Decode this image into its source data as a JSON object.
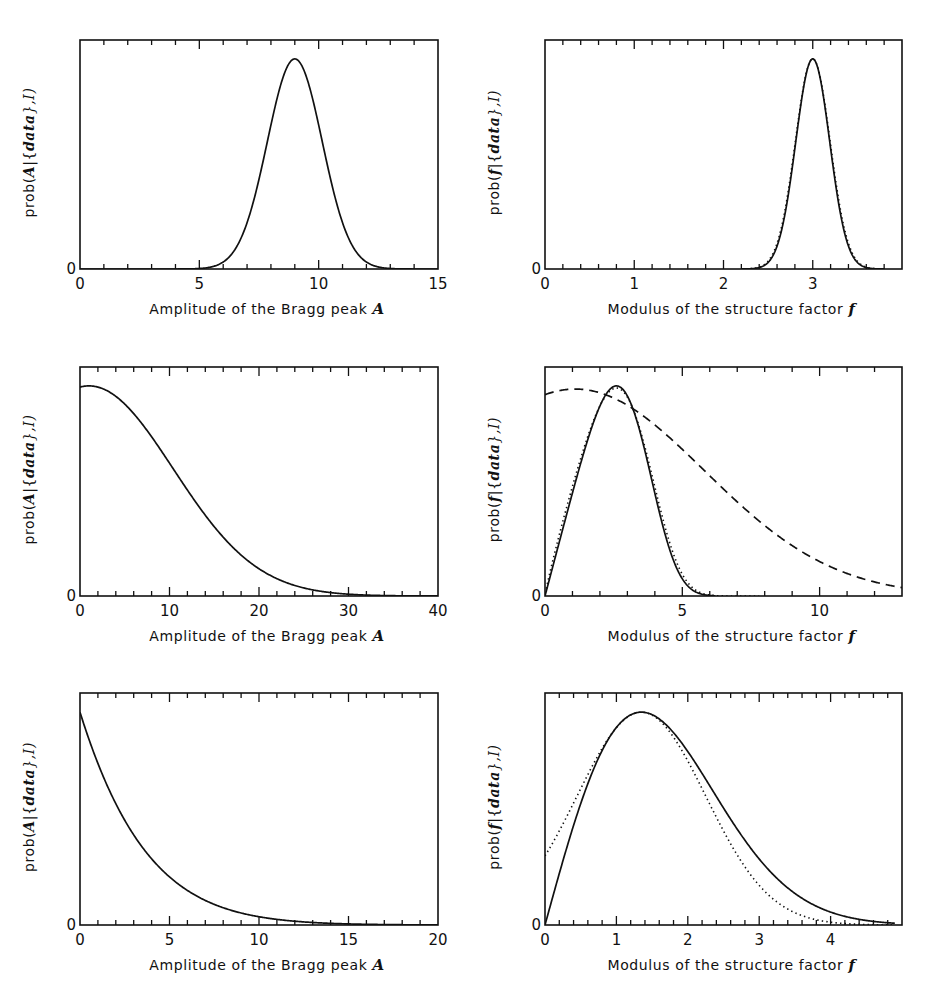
{
  "figure": {
    "ink_color": "#111111",
    "background": "#ffffff"
  },
  "chart_data": [
    {
      "id": "top-left",
      "type": "line",
      "box": [
        80,
        40,
        438,
        269
      ],
      "xlim": [
        0,
        15
      ],
      "xticks": [
        0,
        5,
        10,
        15
      ],
      "minor_step": 1,
      "ylim": [
        0,
        1.09
      ],
      "yticks": [
        0
      ],
      "xlabel": "Amplitude of the Bragg peak",
      "xlabel_symbol": "A",
      "ylabel_prefix": "prob(",
      "ylabel_var": "A",
      "ylabel_mid": "|{",
      "ylabel_data": "data",
      "ylabel_suffix": "},I)",
      "series": [
        {
          "name": "posterior",
          "style": "solid",
          "model": "gauss",
          "mu": 9.0,
          "sigma": 1.15,
          "amp": 1.0,
          "x": [
            0,
            15
          ]
        }
      ]
    },
    {
      "id": "top-right",
      "type": "line",
      "box": [
        545,
        40,
        902,
        269
      ],
      "xlim": [
        0,
        4
      ],
      "xticks": [
        0,
        1,
        2,
        3
      ],
      "minor_step": 0.2,
      "ylim": [
        0,
        1.09
      ],
      "yticks": [
        0
      ],
      "xlabel": "Modulus of the structure factor",
      "xlabel_symbol": "f",
      "ylabel_prefix": "prob(",
      "ylabel_var": "f",
      "ylabel_mid": "|{",
      "ylabel_data": "data",
      "ylabel_suffix": "},I)",
      "series": [
        {
          "name": "exact",
          "style": "solid",
          "model": "gauss",
          "mu": 3.0,
          "sigma": 0.19,
          "amp": 1.0,
          "x": [
            2.2,
            3.8
          ]
        },
        {
          "name": "approx",
          "style": "dotted",
          "model": "gauss",
          "mu": 3.0,
          "sigma": 0.195,
          "amp": 1.0,
          "x": [
            2.2,
            3.8
          ]
        }
      ]
    },
    {
      "id": "middle-left",
      "type": "line",
      "box": [
        80,
        367,
        438,
        596
      ],
      "xlim": [
        0,
        40
      ],
      "xticks": [
        0,
        10,
        20,
        30,
        40
      ],
      "minor_step": 2,
      "ylim": [
        0,
        1.09
      ],
      "yticks": [
        0
      ],
      "xlabel": "Amplitude of the Bragg peak",
      "xlabel_symbol": "A",
      "ylabel_prefix": "prob(",
      "ylabel_var": "A",
      "ylabel_mid": "|{",
      "ylabel_data": "data",
      "ylabel_suffix": "},I)",
      "series": [
        {
          "name": "posterior",
          "style": "solid",
          "model": "gauss",
          "mu": 1.0,
          "sigma": 9.4,
          "amp": 1.0,
          "x": [
            0,
            40
          ]
        }
      ]
    },
    {
      "id": "middle-right",
      "type": "line",
      "box": [
        545,
        367,
        902,
        596
      ],
      "xlim": [
        0,
        13
      ],
      "xticks": [
        0,
        5,
        10
      ],
      "minor_step": 1,
      "ylim": [
        0,
        1.09
      ],
      "yticks": [
        0
      ],
      "xlabel": "Modulus of the structure factor",
      "xlabel_symbol": "f",
      "ylabel_prefix": "prob(",
      "ylabel_var": "f",
      "ylabel_mid": "|{",
      "ylabel_data": "data",
      "ylabel_suffix": "},I)",
      "series": [
        {
          "name": "exact",
          "style": "solid",
          "model": "rice",
          "power": 1.0,
          "scale": 1.0,
          "x": [
            0,
            6.2
          ],
          "peak_x": 2.6,
          "peak_y": 1.0
        },
        {
          "name": "approx",
          "style": "dotted",
          "model": "rice",
          "power": 0.9,
          "scale": 1.18,
          "x": [
            0.05,
            7.8
          ],
          "peak_x": 2.6,
          "peak_y": 0.99
        },
        {
          "name": "broad",
          "style": "dashed",
          "model": "gauss",
          "mu": 1.1,
          "sigma": 4.7,
          "amp": 0.985,
          "x": [
            0,
            13
          ]
        }
      ]
    },
    {
      "id": "bottom-left",
      "type": "line",
      "box": [
        80,
        693,
        438,
        925
      ],
      "xlim": [
        0,
        20
      ],
      "xticks": [
        0,
        5,
        10,
        15,
        20
      ],
      "minor_step": 1,
      "ylim": [
        0,
        1.09
      ],
      "yticks": [
        0
      ],
      "xlabel": "Amplitude of the Bragg peak",
      "xlabel_symbol": "A",
      "ylabel_prefix": "prob(",
      "ylabel_var": "A",
      "ylabel_mid": "|{",
      "ylabel_data": "data",
      "ylabel_suffix": "},I)",
      "series": [
        {
          "name": "posterior",
          "style": "solid",
          "model": "expquad",
          "a": 0.27,
          "b": 0.0055,
          "amp": 1.0,
          "x": [
            0,
            20
          ]
        }
      ]
    },
    {
      "id": "bottom-right",
      "type": "line",
      "box": [
        545,
        693,
        902,
        925
      ],
      "xlim": [
        0,
        5
      ],
      "xticks": [
        0,
        1,
        2,
        3,
        4
      ],
      "minor_step": 0.2,
      "ylim": [
        0,
        1.09
      ],
      "yticks": [
        0
      ],
      "xlabel": "Modulus of the structure factor",
      "xlabel_symbol": "f",
      "ylabel_prefix": "prob(",
      "ylabel_var": "f",
      "ylabel_mid": "|{",
      "ylabel_data": "data",
      "ylabel_suffix": "},I)",
      "series": [
        {
          "name": "exact",
          "style": "solid",
          "model": "rice2",
          "sigma": 1.0,
          "shift": 0.0,
          "x": [
            0,
            4.9
          ],
          "peak_x": 1.35
        },
        {
          "name": "approx",
          "style": "dotted",
          "model": "gauss",
          "mu": 1.35,
          "sigma": 0.9,
          "amp": 1.0,
          "x": [
            0,
            4.9
          ]
        }
      ]
    }
  ]
}
